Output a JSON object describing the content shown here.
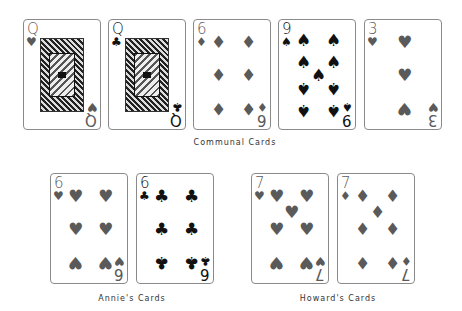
{
  "groups": [
    {
      "label": "Communal Cards",
      "cards": [
        {
          "rank": "Q",
          "suit": "hearts",
          "suit_glyph": "♥",
          "color": "red",
          "type": "face"
        },
        {
          "rank": "Q",
          "suit": "clubs",
          "suit_glyph": "♣",
          "color": "black",
          "type": "face"
        },
        {
          "rank": "6",
          "suit": "diamonds",
          "suit_glyph": "♦",
          "color": "red",
          "type": "pip"
        },
        {
          "rank": "9",
          "suit": "spades",
          "suit_glyph": "♠",
          "color": "black",
          "type": "pip"
        },
        {
          "rank": "3",
          "suit": "hearts",
          "suit_glyph": "♥",
          "color": "red",
          "type": "pip"
        }
      ]
    },
    {
      "label": "Annie's Cards",
      "cards": [
        {
          "rank": "6",
          "suit": "hearts",
          "suit_glyph": "♥",
          "color": "red",
          "type": "pip"
        },
        {
          "rank": "6",
          "suit": "clubs",
          "suit_glyph": "♣",
          "color": "black",
          "type": "pip"
        }
      ]
    },
    {
      "label": "Howard's Cards",
      "cards": [
        {
          "rank": "7",
          "suit": "hearts",
          "suit_glyph": "♥",
          "color": "red",
          "type": "pip"
        },
        {
          "rank": "7",
          "suit": "diamonds",
          "suit_glyph": "♦",
          "color": "red",
          "type": "pip"
        }
      ]
    }
  ],
  "colors": {
    "red_suit": "#5a5a5a",
    "black_suit": "#111111",
    "card_border": "#8a8a8a"
  }
}
